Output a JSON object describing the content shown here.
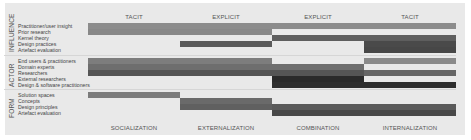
{
  "figure": {
    "top_headers": [
      "TACIT",
      "EXPLICIT",
      "EXPLICIT",
      "TACIT"
    ],
    "bottom_headers": [
      "SOCIALIZATION",
      "EXTERNALIZATION",
      "COMBINATION",
      "INTERNALIZATION"
    ],
    "groups": [
      {
        "name": "INFLUENCE",
        "rows": [
          {
            "label": "Practitioner/user insight",
            "spans": [
              {
                "from": 0,
                "to": 4,
                "shade": "#8c8c8c"
              }
            ]
          },
          {
            "label": "Prior research",
            "spans": [
              {
                "from": 0,
                "to": 2,
                "shade": "#888888"
              }
            ]
          },
          {
            "label": "Kernel theory",
            "spans": [
              {
                "from": 2,
                "to": 4,
                "shade": "#5e5e5e"
              }
            ]
          },
          {
            "label": "Design practices",
            "spans": [
              {
                "from": 1,
                "to": 2,
                "shade": "#5a5a5a"
              },
              {
                "from": 3,
                "to": 4,
                "shade": "#4a4a4a"
              }
            ]
          },
          {
            "label": "Artefact evaluation",
            "spans": [
              {
                "from": 3,
                "to": 4,
                "shade": "#474747"
              }
            ]
          }
        ]
      },
      {
        "name": "ACTOR",
        "rows": [
          {
            "label": "End users & practitioners",
            "spans": [
              {
                "from": 0,
                "to": 2,
                "shade": "#7d7d7d"
              },
              {
                "from": 3,
                "to": 4,
                "shade": "#8a8a8a"
              }
            ]
          },
          {
            "label": "Domain experts",
            "spans": [
              {
                "from": 0,
                "to": 3,
                "shade": "#6e6e6e"
              }
            ]
          },
          {
            "label": "Researchers",
            "spans": [
              {
                "from": 0,
                "to": 3,
                "shade": "#555555"
              },
              {
                "from": 3,
                "to": 4,
                "shade": "#666666"
              }
            ]
          },
          {
            "label": "External researchers",
            "spans": [
              {
                "from": 2,
                "to": 3,
                "shade": "#2a2a2a"
              }
            ]
          },
          {
            "label": "Design & software practitioners",
            "spans": [
              {
                "from": 2,
                "to": 4,
                "shade": "#2e2e2e"
              }
            ]
          }
        ]
      },
      {
        "name": "FORM",
        "rows": [
          {
            "label": "Solution spaces",
            "spans": [
              {
                "from": 0,
                "to": 1,
                "shade": "#7b7b7b"
              }
            ]
          },
          {
            "label": "Concepts",
            "spans": [
              {
                "from": 1,
                "to": 2,
                "shade": "#6a6a6a"
              }
            ]
          },
          {
            "label": "Design principles",
            "spans": [
              {
                "from": 1,
                "to": 2,
                "shade": "#606060"
              },
              {
                "from": 2,
                "to": 4,
                "shade": "#5a5a5a"
              }
            ]
          },
          {
            "label": "Artefact evaluation",
            "spans": [
              {
                "from": 2,
                "to": 4,
                "shade": "#484848"
              }
            ]
          }
        ]
      }
    ]
  }
}
